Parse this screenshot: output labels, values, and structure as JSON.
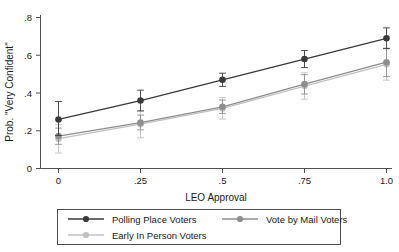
{
  "chart_data": {
    "type": "line",
    "title": "",
    "subtitle": "",
    "xlabel": "LEO Approval",
    "ylabel": "Prob. \"Very Confident\"",
    "x": [
      0,
      0.25,
      0.5,
      0.75,
      1.0
    ],
    "xtick_labels": [
      "0",
      ".25",
      ".5",
      ".75",
      "1.0"
    ],
    "ytick_labels": [
      "0",
      ".2",
      ".4",
      ".6",
      ".8"
    ],
    "ytick_values": [
      0,
      0.2,
      0.4,
      0.6,
      0.8
    ],
    "xlim": [
      -0.06,
      1.06
    ],
    "ylim": [
      0,
      0.86
    ],
    "grid": false,
    "legend_position": "bottom",
    "error_bars": "95% confidence interval",
    "series": [
      {
        "name": "Polling Place Voters",
        "color": "#3a3a3a",
        "marker": "circle",
        "values": [
          0.26,
          0.36,
          0.47,
          0.58,
          0.69
        ],
        "ci_low": [
          0.175,
          0.305,
          0.435,
          0.535,
          0.635
        ],
        "ci_high": [
          0.355,
          0.415,
          0.505,
          0.625,
          0.745
        ]
      },
      {
        "name": "Vote by Mail Voters",
        "color": "#8e8e8e",
        "marker": "circle",
        "values": [
          0.172,
          0.243,
          0.327,
          0.447,
          0.563
        ],
        "ci_low": [
          0.128,
          0.205,
          0.292,
          0.395,
          0.487
        ],
        "ci_high": [
          0.214,
          0.283,
          0.363,
          0.497,
          0.637
        ]
      },
      {
        "name": "Early In Person Voters",
        "color": "#c2c2c2",
        "marker": "circle",
        "values": [
          0.158,
          0.235,
          0.318,
          0.437,
          0.552
        ],
        "ci_low": [
          0.082,
          0.163,
          0.262,
          0.367,
          0.468
        ],
        "ci_high": [
          0.232,
          0.305,
          0.376,
          0.507,
          0.637
        ]
      }
    ]
  },
  "axes": {
    "x_title": "LEO Approval",
    "y_title": "Prob. \"Very Confident\"",
    "x_ticks": [
      "0",
      ".25",
      ".5",
      ".75",
      "1.0"
    ],
    "y_ticks": [
      "0",
      ".2",
      ".4",
      ".6",
      ".8"
    ]
  },
  "legend": {
    "entries": [
      {
        "label": "Polling Place Voters",
        "color": "#3a3a3a"
      },
      {
        "label": "Vote by Mail Voters",
        "color": "#8e8e8e"
      },
      {
        "label": "Early In Person Voters",
        "color": "#c2c2c2"
      }
    ]
  }
}
